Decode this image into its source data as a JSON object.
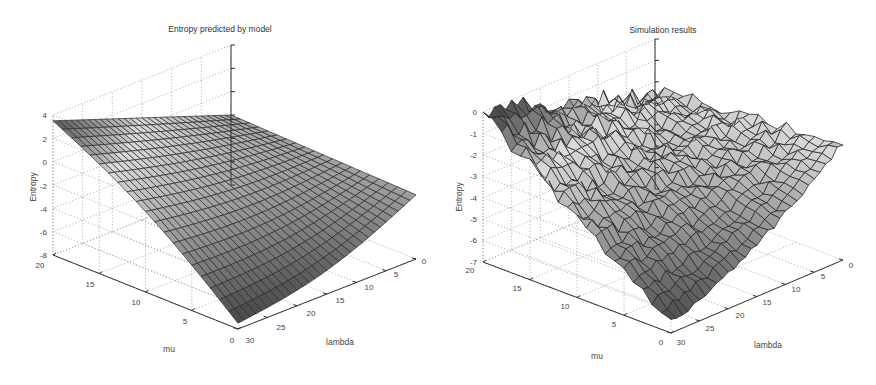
{
  "chart_data": [
    {
      "type": "surface3d",
      "title": "Entropy predicted by model",
      "xlabel": "lambda",
      "ylabel": "mu",
      "zlabel": "Entropy",
      "xlim": [
        0,
        30
      ],
      "ylim": [
        0,
        20
      ],
      "zlim": [
        -8,
        4
      ],
      "xticks": [
        0,
        5,
        10,
        15,
        20,
        25,
        30
      ],
      "yticks": [
        0,
        5,
        10,
        15,
        20
      ],
      "zticks": [
        -8,
        -6,
        -4,
        -2,
        0,
        2,
        4
      ],
      "grid": true,
      "colormap": "gray",
      "surface_desc": "Smooth surface; Entropy ~ -2 at mu=20,lambda=0, rising to ~3.5 at high mu, high lambda (back corner), dropping to ~ -8 near mu=0, lambda=30 (front corner) and around -2 at mu=0, lambda=0",
      "corner_values": {
        "mu20_lambda0": -2,
        "mu20_lambda30": 3.5,
        "mu0_lambda0": -2.5,
        "mu0_lambda30": -7.5
      },
      "grid_resolution": [
        30,
        20
      ]
    },
    {
      "type": "surface3d",
      "title": "Simulation results",
      "xlabel": "lambda",
      "ylabel": "mu",
      "zlabel": "Entropy",
      "xlim": [
        0,
        30
      ],
      "ylim": [
        0,
        20
      ],
      "zlim": [
        -7,
        0
      ],
      "xticks": [
        0,
        5,
        10,
        15,
        20,
        25,
        30
      ],
      "yticks": [
        0,
        5,
        10,
        15,
        20
      ],
      "zticks": [
        -7,
        -6,
        -5,
        -4,
        -3,
        -2,
        -1,
        0
      ],
      "grid": true,
      "colormap": "gray",
      "surface_desc": "Noisy surface resembling the model; Entropy ~ -2.5 at mu=20,lambda=0, near 0 at back corner, about -1.5 at mu=0,lambda=0, down to ~ -6.5 at mu=0, lambda=30",
      "corner_values": {
        "mu20_lambda0": -2.5,
        "mu20_lambda30": 0,
        "mu0_lambda0": -1.5,
        "mu0_lambda30": -6.5
      },
      "noise_amplitude": 0.35,
      "grid_resolution": [
        30,
        20
      ]
    }
  ],
  "plots": [
    {
      "title": "Entropy predicted by model",
      "zlabel": "Entropy",
      "xlabel": "lambda",
      "ylabel": "mu",
      "zticks": [
        "4",
        "2",
        "0",
        "-2",
        "-4",
        "-6",
        "-8"
      ],
      "muticks": [
        "20",
        "15",
        "10",
        "5",
        "0"
      ],
      "lambdaticks": [
        "30",
        "25",
        "20",
        "15",
        "10",
        "5",
        "0"
      ]
    },
    {
      "title": "Simulation results",
      "zlabel": "Entropy",
      "xlabel": "lambda",
      "ylabel": "mu",
      "zticks": [
        "0",
        "-1",
        "-2",
        "-3",
        "-4",
        "-5",
        "-6",
        "-7"
      ],
      "muticks": [
        "20",
        "15",
        "10",
        "5",
        "0"
      ],
      "lambdaticks": [
        "30",
        "25",
        "20",
        "15",
        "10",
        "5",
        "0"
      ]
    }
  ]
}
